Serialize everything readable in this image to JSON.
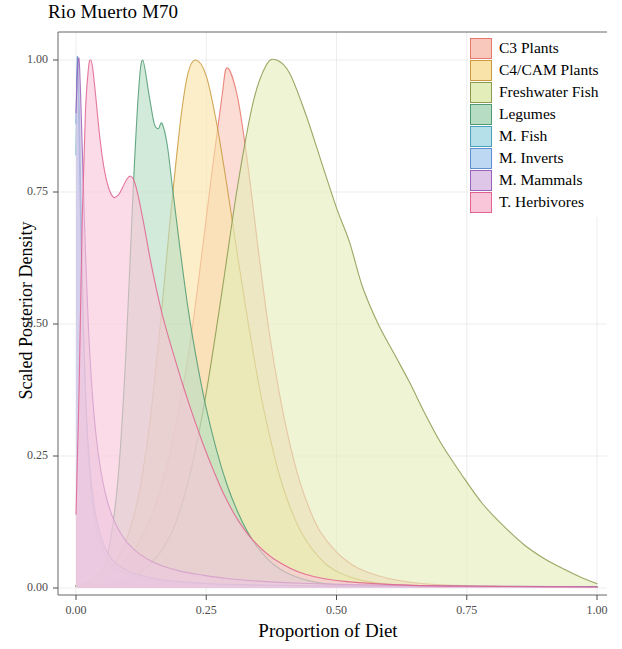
{
  "chart_data": {
    "type": "area",
    "title": "Rio Muerto M70",
    "xlabel": "Proportion of Diet",
    "ylabel": "Scaled Posterior Density",
    "xlim": [
      0,
      1
    ],
    "ylim": [
      0,
      1.04
    ],
    "xticks": [
      "0.00",
      "0.25",
      "0.50",
      "0.75",
      "1.00"
    ],
    "xtick_values": [
      0,
      0.25,
      0.5,
      0.75,
      1
    ],
    "yticks": [
      "0.00",
      "0.25",
      "0.50",
      "0.75",
      "1.00"
    ],
    "ytick_values": [
      0,
      0.25,
      0.5,
      0.75,
      1
    ],
    "grid": true,
    "legend_position": "top-right",
    "panel_background": "#ffffff",
    "series": [
      {
        "name": "C3 Plants",
        "fill": "#f9c8bd",
        "stroke": "#e8766a",
        "mode": 0.29,
        "x": [
          0.0,
          0.02,
          0.04,
          0.06,
          0.08,
          0.1,
          0.12,
          0.14,
          0.16,
          0.18,
          0.2,
          0.22,
          0.24,
          0.26,
          0.28,
          0.29,
          0.31,
          0.33,
          0.35,
          0.37,
          0.39,
          0.41,
          0.43,
          0.45,
          0.47,
          0.5,
          0.53,
          0.56,
          0.6,
          0.65,
          0.7,
          0.8,
          0.9,
          1.0
        ],
        "y": [
          0.005,
          0.009,
          0.015,
          0.024,
          0.038,
          0.058,
          0.085,
          0.125,
          0.18,
          0.255,
          0.35,
          0.47,
          0.62,
          0.78,
          0.93,
          0.985,
          0.93,
          0.8,
          0.64,
          0.49,
          0.37,
          0.275,
          0.2,
          0.145,
          0.105,
          0.068,
          0.044,
          0.03,
          0.018,
          0.01,
          0.006,
          0.003,
          0.002,
          0.002
        ]
      },
      {
        "name": "C4/CAM Plants",
        "fill": "#f9e3a8",
        "stroke": "#c99a3f",
        "mode": 0.23,
        "x": [
          0.0,
          0.02,
          0.04,
          0.06,
          0.08,
          0.1,
          0.12,
          0.14,
          0.16,
          0.18,
          0.2,
          0.215,
          0.23,
          0.25,
          0.27,
          0.29,
          0.31,
          0.33,
          0.35,
          0.37,
          0.39,
          0.41,
          0.43,
          0.45,
          0.48,
          0.51,
          0.55,
          0.6,
          0.7,
          0.85,
          1.0
        ],
        "y": [
          0.004,
          0.008,
          0.016,
          0.03,
          0.055,
          0.1,
          0.175,
          0.3,
          0.48,
          0.69,
          0.88,
          0.975,
          1.0,
          0.97,
          0.88,
          0.76,
          0.63,
          0.505,
          0.39,
          0.295,
          0.215,
          0.155,
          0.11,
          0.078,
          0.045,
          0.027,
          0.014,
          0.007,
          0.003,
          0.002,
          0.002
        ]
      },
      {
        "name": "Freshwater Fish",
        "fill": "#e3edb9",
        "stroke": "#8a9a4e",
        "mode": 0.385,
        "x": [
          0.0,
          0.04,
          0.08,
          0.12,
          0.16,
          0.19,
          0.22,
          0.25,
          0.28,
          0.31,
          0.34,
          0.365,
          0.385,
          0.41,
          0.44,
          0.47,
          0.5,
          0.525,
          0.55,
          0.58,
          0.61,
          0.64,
          0.67,
          0.7,
          0.74,
          0.78,
          0.82,
          0.86,
          0.9,
          0.94,
          0.97,
          1.0
        ],
        "y": [
          0.003,
          0.006,
          0.013,
          0.028,
          0.065,
          0.12,
          0.22,
          0.37,
          0.56,
          0.76,
          0.92,
          0.99,
          1.0,
          0.975,
          0.9,
          0.81,
          0.72,
          0.655,
          0.57,
          0.5,
          0.445,
          0.39,
          0.33,
          0.275,
          0.215,
          0.16,
          0.118,
          0.082,
          0.055,
          0.034,
          0.02,
          0.008
        ]
      },
      {
        "name": "Legumes",
        "fill": "#b6ddc3",
        "stroke": "#4f9a72",
        "mode": 0.128,
        "x": [
          0.0,
          0.02,
          0.04,
          0.06,
          0.08,
          0.095,
          0.11,
          0.12,
          0.128,
          0.14,
          0.15,
          0.158,
          0.165,
          0.175,
          0.185,
          0.2,
          0.215,
          0.23,
          0.25,
          0.27,
          0.29,
          0.31,
          0.33,
          0.35,
          0.38,
          0.41,
          0.45,
          0.5,
          0.6,
          0.8,
          1.0
        ],
        "y": [
          0.004,
          0.01,
          0.024,
          0.06,
          0.2,
          0.43,
          0.76,
          0.94,
          1.0,
          0.935,
          0.88,
          0.87,
          0.88,
          0.84,
          0.76,
          0.64,
          0.53,
          0.44,
          0.34,
          0.26,
          0.195,
          0.145,
          0.105,
          0.075,
          0.044,
          0.026,
          0.013,
          0.006,
          0.003,
          0.002,
          0.002
        ]
      },
      {
        "name": "M. Fish",
        "fill": "#b5dfe9",
        "stroke": "#4b9fb8",
        "mode": 0.004,
        "x": [
          0.0,
          0.002,
          0.004,
          0.007,
          0.01,
          0.014,
          0.019,
          0.025,
          0.032,
          0.042,
          0.055,
          0.07,
          0.09,
          0.115,
          0.145,
          0.185,
          0.24,
          0.32,
          0.42,
          0.55,
          0.7,
          0.85,
          1.0
        ],
        "y": [
          0.82,
          0.96,
          1.0,
          0.88,
          0.7,
          0.51,
          0.35,
          0.235,
          0.155,
          0.1,
          0.065,
          0.044,
          0.03,
          0.021,
          0.015,
          0.011,
          0.008,
          0.005,
          0.004,
          0.003,
          0.002,
          0.002,
          0.002
        ]
      },
      {
        "name": "M. Inverts",
        "fill": "#bcd8f2",
        "stroke": "#5f8fd0",
        "mode": 0.003,
        "x": [
          0.0,
          0.002,
          0.003,
          0.005,
          0.008,
          0.012,
          0.017,
          0.023,
          0.031,
          0.041,
          0.054,
          0.07,
          0.092,
          0.12,
          0.155,
          0.2,
          0.26,
          0.34,
          0.45,
          0.6,
          0.8,
          1.0
        ],
        "y": [
          0.88,
          0.985,
          1.0,
          0.9,
          0.74,
          0.56,
          0.4,
          0.275,
          0.185,
          0.122,
          0.08,
          0.053,
          0.036,
          0.025,
          0.017,
          0.012,
          0.008,
          0.006,
          0.004,
          0.003,
          0.002,
          0.002
        ]
      },
      {
        "name": "M. Mammals",
        "fill": "#ddc6e8",
        "stroke": "#9a62b8",
        "mode": 0.006,
        "x": [
          0.0,
          0.003,
          0.006,
          0.009,
          0.013,
          0.018,
          0.024,
          0.032,
          0.042,
          0.055,
          0.07,
          0.088,
          0.11,
          0.135,
          0.165,
          0.2,
          0.24,
          0.29,
          0.35,
          0.43,
          0.55,
          0.7,
          0.85,
          1.0
        ],
        "y": [
          0.9,
          0.985,
          1.0,
          0.93,
          0.8,
          0.64,
          0.49,
          0.36,
          0.26,
          0.185,
          0.135,
          0.1,
          0.074,
          0.056,
          0.042,
          0.032,
          0.025,
          0.018,
          0.013,
          0.009,
          0.006,
          0.004,
          0.003,
          0.002
        ]
      },
      {
        "name": "T. Herbivores",
        "fill": "#f9c5d8",
        "stroke": "#e0628f",
        "mode": 0.032,
        "x": [
          0.0,
          0.006,
          0.012,
          0.018,
          0.024,
          0.028,
          0.032,
          0.038,
          0.045,
          0.053,
          0.062,
          0.072,
          0.082,
          0.09,
          0.098,
          0.105,
          0.112,
          0.12,
          0.13,
          0.145,
          0.165,
          0.185,
          0.205,
          0.225,
          0.245,
          0.265,
          0.285,
          0.31,
          0.34,
          0.38,
          0.44,
          0.52,
          0.65,
          0.8,
          1.0
        ],
        "y": [
          0.14,
          0.38,
          0.7,
          0.9,
          0.985,
          1.0,
          0.985,
          0.93,
          0.86,
          0.8,
          0.76,
          0.74,
          0.745,
          0.76,
          0.775,
          0.78,
          0.77,
          0.74,
          0.69,
          0.61,
          0.52,
          0.45,
          0.385,
          0.325,
          0.27,
          0.22,
          0.175,
          0.13,
          0.09,
          0.055,
          0.026,
          0.012,
          0.005,
          0.003,
          0.002
        ]
      }
    ]
  },
  "legend": {
    "items": [
      {
        "label": "C3 Plants",
        "color": "#f9c8bd",
        "border": "#e8766a"
      },
      {
        "label": "C4/CAM Plants",
        "color": "#f9e3a8",
        "border": "#c99a3f"
      },
      {
        "label": "Freshwater Fish",
        "color": "#e3edb9",
        "border": "#8a9a4e"
      },
      {
        "label": "Legumes",
        "color": "#b6ddc3",
        "border": "#4f9a72"
      },
      {
        "label": "M. Fish",
        "color": "#b5dfe9",
        "border": "#4b9fb8"
      },
      {
        "label": "M. Inverts",
        "color": "#bcd8f2",
        "border": "#5f8fd0"
      },
      {
        "label": "M. Mammals",
        "color": "#ddc6e8",
        "border": "#9a62b8"
      },
      {
        "label": "T. Herbivores",
        "color": "#f9c5d8",
        "border": "#e0628f"
      }
    ]
  }
}
